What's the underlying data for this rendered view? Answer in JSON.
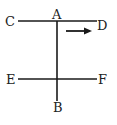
{
  "diagram": {
    "type": "geometry",
    "colors": {
      "line": "#1a1a1a",
      "text": "#222222",
      "background": "#ffffff"
    },
    "points": {
      "A": {
        "label": "A",
        "x": 57,
        "y": 15
      },
      "B": {
        "label": "B",
        "x": 57,
        "y": 112
      },
      "C": {
        "label": "C",
        "x": 9,
        "y": 26
      },
      "D": {
        "label": "D",
        "x": 104,
        "y": 30
      },
      "E": {
        "label": "E",
        "x": 12,
        "y": 84
      },
      "F": {
        "label": "F",
        "x": 102,
        "y": 84
      }
    },
    "lines": [
      {
        "name": "CD",
        "x1": 18,
        "y1": 21,
        "x2": 97,
        "y2": 21
      },
      {
        "name": "EF",
        "x1": 18,
        "y1": 79,
        "x2": 97,
        "y2": 79
      },
      {
        "name": "AB",
        "x1": 57,
        "y1": 21,
        "x2": 57,
        "y2": 101
      }
    ],
    "arrow": {
      "direction": "right",
      "x1": 66,
      "y1": 31,
      "x2": 92,
      "y2": 31
    }
  }
}
